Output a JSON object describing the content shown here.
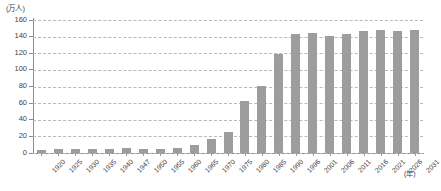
{
  "chart_data": {
    "type": "bar",
    "title": "",
    "subtitle": "",
    "xlabel": "(年)",
    "ylabel": "(万人)",
    "ylim": [
      0,
      160
    ],
    "ytick_step": 20,
    "yticks": [
      "160",
      "140",
      "120",
      "100",
      "80",
      "60",
      "40",
      "20",
      "0"
    ],
    "grid": true,
    "legend": null,
    "bar_color": "#9d9d9d",
    "gridline_color": "#b9b9b9",
    "axis_color": "#8c8c8c",
    "categories": [
      "1920",
      "1925",
      "1930",
      "1935",
      "1940",
      "1947",
      "1950",
      "1955",
      "1960",
      "1965",
      "1970",
      "1975",
      "1980",
      "1985",
      "1990",
      "1996",
      "2001",
      "2006",
      "2011",
      "2016",
      "2021",
      "2026",
      "2031"
    ],
    "values": [
      3,
      4,
      4,
      4,
      4,
      5,
      4,
      4,
      5,
      9,
      16,
      25,
      62,
      80,
      119,
      142,
      144,
      140,
      143,
      146,
      147,
      146,
      147
    ],
    "series": [
      {
        "name": "",
        "values": [
          3,
          4,
          4,
          4,
          4,
          5,
          4,
          4,
          5,
          9,
          16,
          25,
          62,
          80,
          119,
          142,
          144,
          140,
          143,
          146,
          147,
          146,
          147
        ]
      }
    ]
  }
}
